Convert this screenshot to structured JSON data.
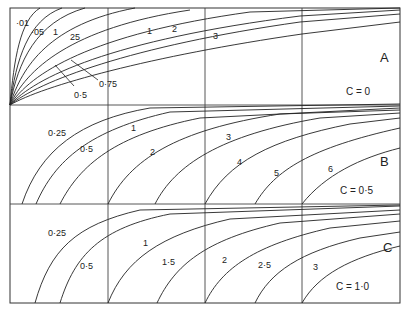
{
  "figure": {
    "panels": [
      {
        "id": "A",
        "panel_label": "A",
        "condition": "C = 0",
        "curve_labels": [
          "·01",
          "·05",
          "·1",
          "·25",
          "0·5",
          "0·75",
          "1",
          "2",
          "3"
        ]
      },
      {
        "id": "B",
        "panel_label": "B",
        "condition": "C = 0·5",
        "curve_labels": [
          "0·25",
          "0·5",
          "1",
          "2",
          "3",
          "4",
          "5",
          "6"
        ]
      },
      {
        "id": "C",
        "panel_label": "C",
        "condition": "C = 1·0",
        "curve_labels": [
          "0·25",
          "0·5",
          "1",
          "1·5",
          "2",
          "2·5",
          "3"
        ]
      }
    ],
    "labels": {
      "A": {
        "l01": "·01",
        "l05": "·05",
        "l1": "1",
        "l25": "25",
        "l05b": "0·5",
        "l075": "0·75",
        "one": "1",
        "two": "2",
        "three": "3"
      },
      "B": {
        "l025": "0·25",
        "l05": "0·5",
        "one": "1",
        "two": "2",
        "three": "3",
        "four": "4",
        "five": "5",
        "six": "6"
      },
      "C": {
        "l025": "0·25",
        "l05": "0·5",
        "one": "1",
        "l15": "1·5",
        "two": "2",
        "l25": "2·5",
        "three": "3"
      }
    },
    "colors": {
      "line": "#222222",
      "background": "#ffffff"
    }
  }
}
